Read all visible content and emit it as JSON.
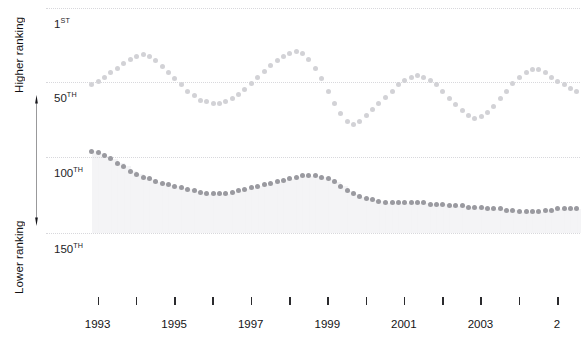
{
  "chart_data": {
    "type": "line",
    "title": "",
    "subtitle": "",
    "xlabel": "",
    "ylabel": "",
    "legend_position": "none",
    "grid": true,
    "y_axis": {
      "label_top": "Higher ranking",
      "label_bottom": "Lower ranking",
      "inverted": true,
      "ticks": [
        1,
        50,
        100,
        150
      ],
      "tick_labels": [
        "1ST",
        "50TH",
        "100TH",
        "150TH"
      ],
      "tick_label_numbers": [
        "1",
        "50",
        "100",
        "150"
      ],
      "tick_label_suffixes": [
        "ST",
        "TH",
        "TH",
        "TH"
      ],
      "ylim": [
        1,
        160
      ]
    },
    "x_axis": {
      "ticks": [
        1993,
        1994,
        1995,
        1996,
        1997,
        1998,
        1999,
        2000,
        2001,
        2002,
        2003,
        2004,
        2005
      ],
      "tick_labels": [
        "1993",
        "",
        "1995",
        "",
        "1997",
        "",
        "1999",
        "",
        "2001",
        "",
        "2003",
        "",
        "2"
      ],
      "visible_labels": [
        "1993",
        "1995",
        "1997",
        "1999",
        "2001",
        "2003",
        "2"
      ],
      "xlim": [
        1992.75,
        2005.6
      ],
      "note_truncated_right": "2005 label clipped at right edge"
    },
    "series": [
      {
        "name": "upper-series",
        "color": "#d2d2d6",
        "marker": "dot",
        "x": [
          1992.85,
          1993.02,
          1993.19,
          1993.35,
          1993.52,
          1993.69,
          1993.85,
          1994.02,
          1994.19,
          1994.35,
          1994.52,
          1994.69,
          1994.85,
          1995.02,
          1995.19,
          1995.35,
          1995.52,
          1995.69,
          1995.85,
          1996.02,
          1996.19,
          1996.35,
          1996.52,
          1996.69,
          1996.85,
          1997.02,
          1997.19,
          1997.35,
          1997.52,
          1997.69,
          1997.85,
          1998.02,
          1998.19,
          1998.35,
          1998.52,
          1998.69,
          1998.85,
          1999.02,
          1999.19,
          1999.35,
          1999.52,
          1999.69,
          1999.85,
          2000.02,
          2000.19,
          2000.35,
          2000.52,
          2000.69,
          2000.85,
          2001.02,
          2001.19,
          2001.35,
          2001.52,
          2001.69,
          2001.85,
          2002.02,
          2002.19,
          2002.35,
          2002.52,
          2002.69,
          2002.85,
          2003.02,
          2003.19,
          2003.35,
          2003.52,
          2003.69,
          2003.85,
          2004.02,
          2004.19,
          2004.35,
          2004.52,
          2004.69,
          2004.85,
          2005.02,
          2005.19,
          2005.35,
          2005.52
        ],
        "values": [
          52,
          50,
          47,
          44,
          41,
          38,
          35,
          33,
          32,
          33,
          36,
          40,
          44,
          48,
          52,
          56,
          59,
          62,
          63,
          64,
          64,
          63,
          61,
          58,
          55,
          51,
          47,
          43,
          39,
          36,
          33,
          31,
          30,
          31,
          35,
          41,
          48,
          56,
          64,
          71,
          76,
          78,
          76,
          72,
          68,
          64,
          60,
          56,
          52,
          49,
          47,
          46,
          47,
          49,
          52,
          56,
          61,
          65,
          69,
          72,
          74,
          73,
          70,
          66,
          61,
          56,
          51,
          47,
          44,
          42,
          42,
          44,
          47,
          50,
          52,
          54,
          56
        ]
      },
      {
        "name": "lower-series",
        "color": "#9a9aa0",
        "marker": "dot",
        "x": [
          1992.85,
          1993.02,
          1993.19,
          1993.35,
          1993.52,
          1993.69,
          1993.85,
          1994.02,
          1994.19,
          1994.35,
          1994.52,
          1994.69,
          1994.85,
          1995.02,
          1995.19,
          1995.35,
          1995.52,
          1995.69,
          1995.85,
          1996.02,
          1996.19,
          1996.35,
          1996.52,
          1996.69,
          1996.85,
          1997.02,
          1997.19,
          1997.35,
          1997.52,
          1997.69,
          1997.85,
          1998.02,
          1998.19,
          1998.35,
          1998.52,
          1998.69,
          1998.85,
          1999.02,
          1999.19,
          1999.35,
          1999.52,
          1999.69,
          1999.85,
          2000.02,
          2000.19,
          2000.35,
          2000.52,
          2000.69,
          2000.85,
          2001.02,
          2001.19,
          2001.35,
          2001.52,
          2001.69,
          2001.85,
          2002.02,
          2002.19,
          2002.35,
          2002.52,
          2002.69,
          2002.85,
          2003.02,
          2003.19,
          2003.35,
          2003.52,
          2003.69,
          2003.85,
          2004.02,
          2004.19,
          2004.35,
          2004.52,
          2004.69,
          2004.85,
          2005.02,
          2005.19,
          2005.35,
          2005.52
        ],
        "values": [
          96,
          97,
          99,
          101,
          104,
          106,
          109,
          111,
          113,
          114,
          116,
          117,
          118,
          119,
          120,
          121,
          122,
          123,
          124,
          124,
          124,
          124,
          123,
          122,
          121,
          120,
          119,
          118,
          117,
          116,
          115,
          114,
          113,
          112,
          112,
          112,
          113,
          114,
          116,
          119,
          122,
          124,
          126,
          127,
          128,
          129,
          130,
          130,
          130,
          130,
          130,
          130,
          130,
          131,
          131,
          131,
          132,
          132,
          132,
          133,
          133,
          133,
          134,
          134,
          134,
          135,
          135,
          136,
          136,
          136,
          136,
          135,
          135,
          134,
          134,
          134,
          134
        ]
      }
    ],
    "shaded_band": {
      "description": "light grey band filling from lower-series down to the 150th gridline",
      "color": "#f2f2f4"
    }
  }
}
